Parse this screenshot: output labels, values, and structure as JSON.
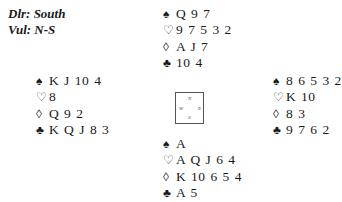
{
  "deal_info": {
    "dealer": "Dlr: South",
    "vulnerability": "Vul: N-S"
  },
  "suit_symbols": {
    "spades": "♠",
    "hearts": "♡",
    "diamonds": "◊",
    "clubs": "♣"
  },
  "hands": {
    "north": {
      "spades": "Q 9 7",
      "hearts": "9 7 5 3 2",
      "diamonds": "A J 7",
      "clubs": "10 4"
    },
    "west": {
      "spades": "K J 10 4",
      "hearts": "8",
      "diamonds": "Q 9 2",
      "clubs": "K Q J 8 3"
    },
    "east": {
      "spades": "8 6 5 3 2",
      "hearts": "K 10",
      "diamonds": "8 3",
      "clubs": "9 7 6 2"
    },
    "south": {
      "spades": "A",
      "hearts": "A Q J 6 4",
      "diamonds": "K 10 6 5 4",
      "clubs": "A 5"
    }
  },
  "compass": {
    "n": "N",
    "w": "W",
    "e": "E",
    "s": "S"
  }
}
